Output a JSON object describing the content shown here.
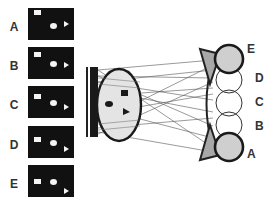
{
  "figure": {
    "stimuli": [
      {
        "label": "A",
        "top": 8,
        "square": [
          6,
          2
        ],
        "round": [
          24,
          16
        ],
        "triangle": [
          36,
          15
        ]
      },
      {
        "label": "B",
        "top": 47,
        "square": [
          6,
          6
        ],
        "round": [
          24,
          15
        ],
        "triangle": [
          36,
          16
        ]
      },
      {
        "label": "C",
        "top": 86,
        "square": [
          6,
          9
        ],
        "round": [
          24,
          15
        ],
        "triangle": [
          36,
          18
        ]
      },
      {
        "label": "D",
        "top": 126,
        "square": [
          6,
          12
        ],
        "round": [
          24,
          15
        ],
        "triangle": [
          36,
          21
        ]
      },
      {
        "label": "E",
        "top": 165,
        "square": [
          6,
          15
        ],
        "round": [
          24,
          15
        ],
        "triangle": [
          36,
          24
        ]
      }
    ],
    "positions": [
      {
        "label": "E",
        "x": 247,
        "y": 44
      },
      {
        "label": "D",
        "x": 255,
        "y": 72
      },
      {
        "label": "C",
        "x": 255,
        "y": 96
      },
      {
        "label": "B",
        "x": 255,
        "y": 120
      },
      {
        "label": "A",
        "x": 247,
        "y": 148
      }
    ],
    "colors": {
      "stimulus_bg": "#111111",
      "ellipse_fill": "#e4e4e4",
      "circle_fill": "#cfcfcf",
      "stroke": "#222222",
      "ray": "#555555"
    }
  }
}
